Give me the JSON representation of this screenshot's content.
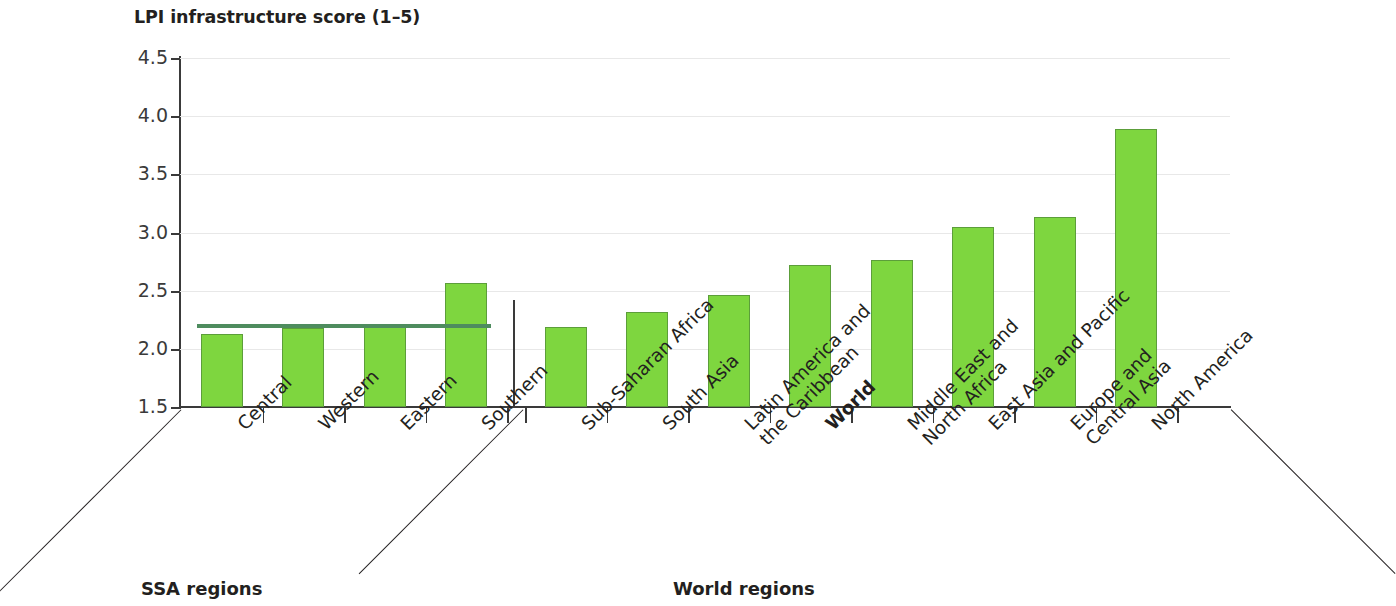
{
  "chart_data": {
    "type": "bar",
    "title": "LPI infrastructure score (1–5)",
    "xlabel": "",
    "ylabel": "LPI infrastructure score (1–5)",
    "ylim": [
      1.5,
      4.5
    ],
    "ytick_labels": [
      "4.5",
      "4.0",
      "3.5",
      "3.0",
      "2.5",
      "2.0",
      "1.5"
    ],
    "ytick_values": [
      4.5,
      4.0,
      3.5,
      3.0,
      2.5,
      2.0,
      1.5
    ],
    "grid": true,
    "legend_position": "none",
    "bar_color": "#7ed63f",
    "bar_edge_color": "#5c9e3a",
    "reference_line_color": "#4e8c5e",
    "groups": [
      {
        "name": "SSA regions",
        "categories": [
          "Central",
          "Western",
          "Eastern",
          "Southern"
        ],
        "values": [
          2.13,
          2.18,
          2.19,
          2.57
        ]
      },
      {
        "name": "World regions",
        "categories": [
          "Sub-Saharan Africa",
          "South Asia",
          "Latin America and\nthe Caribbean",
          "World",
          "Middle East and\nNorth Africa",
          "East Asia and Pacific",
          "Europe and\nCentral Asia",
          "North America"
        ],
        "values": [
          2.19,
          2.32,
          2.46,
          2.72,
          2.76,
          3.05,
          3.13,
          3.89
        ],
        "emphasized": [
          "World"
        ]
      }
    ],
    "annotations": [
      {
        "type": "reference_line",
        "label": "SSA average",
        "value": 2.2,
        "spans_categories": [
          "Central",
          "Western",
          "Eastern",
          "Southern"
        ]
      }
    ],
    "categories": [
      "Central",
      "Western",
      "Eastern",
      "Southern",
      "Sub-Saharan Africa",
      "South Asia",
      "Latin America and\nthe Caribbean",
      "World",
      "Middle East and\nNorth Africa",
      "East Asia and Pacific",
      "Europe and\nCentral Asia",
      "North America"
    ],
    "values": [
      2.13,
      2.18,
      2.19,
      2.57,
      2.19,
      2.32,
      2.46,
      2.72,
      2.76,
      3.05,
      3.13,
      3.89
    ]
  },
  "axis": {
    "group_label_ssa": "SSA regions",
    "group_label_world": "World regions"
  }
}
